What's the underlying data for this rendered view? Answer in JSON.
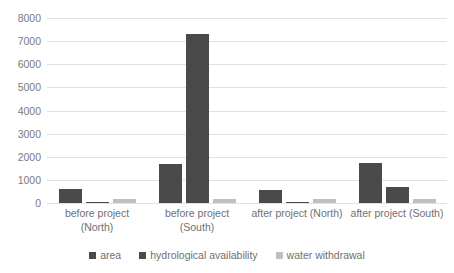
{
  "chart_data": {
    "type": "bar",
    "title": "",
    "subtitle": "",
    "xlabel": "",
    "ylabel": "",
    "ylim": [
      0,
      8000
    ],
    "ytick_step": 1000,
    "yticks": [
      "0",
      "1000",
      "2000",
      "3000",
      "4000",
      "5000",
      "6000",
      "7000",
      "8000"
    ],
    "grid": true,
    "legend_position": "bottom",
    "categories": [
      "before project\n(North)",
      "before project\n(South)",
      "after project (North)",
      "after project (South)"
    ],
    "series": [
      {
        "name": "area",
        "color": "#4a4a4a",
        "values": [
          600,
          1700,
          570,
          1750
        ]
      },
      {
        "name": "hydrological availability",
        "color": "#4a4a4a",
        "values": [
          60,
          7330,
          55,
          700
        ]
      },
      {
        "name": "water withdrawal",
        "color": "#bfbfbf",
        "values": [
          170,
          175,
          165,
          170
        ]
      }
    ]
  },
  "legend": {
    "items": [
      {
        "label": "area",
        "color": "#4a4a4a"
      },
      {
        "label": "hydrological availability",
        "color": "#4a4a4a"
      },
      {
        "label": "water withdrawal",
        "color": "#bfbfbf"
      }
    ]
  },
  "colors": {
    "dark_bar": "#4a4a4a",
    "light_bar": "#bfbfbf",
    "gridline": "#e2e2e2",
    "axis_text": "#7b7b7b",
    "background": "#ffffff"
  }
}
